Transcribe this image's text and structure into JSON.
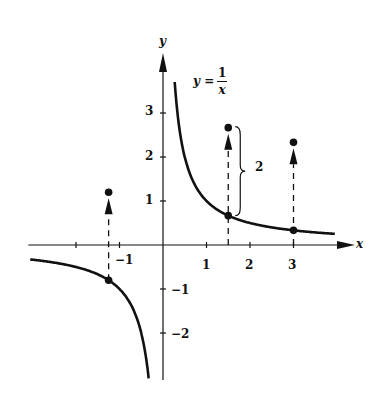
{
  "chart_data": {
    "type": "line",
    "title": "",
    "function_label": {
      "lhs": "y",
      "eq": "=",
      "numerator": "1",
      "denominator": "x"
    },
    "xlabel": "x",
    "ylabel": "y",
    "x_ticks": [
      -2,
      -1,
      0,
      1,
      2,
      3
    ],
    "x_tick_labels": [
      "-1",
      "1",
      "2",
      "3"
    ],
    "y_ticks": [
      -2,
      -1,
      1,
      2,
      3
    ],
    "y_tick_labels": [
      "3",
      "2",
      "1",
      "−1",
      "−2"
    ],
    "xlim": [
      -3.05,
      4.3
    ],
    "ylim": [
      -3.1,
      4.4
    ],
    "grid": false,
    "series": [
      {
        "name": "y = 1/x (x>0)",
        "x_range": [
          0.27,
          3.95
        ]
      },
      {
        "name": "y = 1/x (x<0)",
        "x_range": [
          -3.05,
          -0.33
        ]
      }
    ],
    "highlighted_points": [
      {
        "x": -1.25,
        "y_curve": -0.8,
        "y_shifted": 1.2
      },
      {
        "x": 1.5,
        "y_curve": 0.667,
        "y_shifted": 2.667
      },
      {
        "x": 3,
        "y_curve": 0.333,
        "y_shifted": 2.333
      }
    ],
    "annotations": [
      {
        "type": "brace",
        "label": "2",
        "x": 1.5,
        "from": 0.667,
        "to": 2.667
      }
    ],
    "shift": 2
  },
  "labels": {
    "x_axis": "x",
    "y_axis": "y",
    "brace": "2",
    "xt_m1": "−1",
    "xt_1": "1",
    "xt_2": "2",
    "xt_3": "3",
    "yt_3": "3",
    "yt_2": "2",
    "yt_1": "1",
    "yt_m1": "−1",
    "yt_m2": "−2",
    "eq_lhs": "y =",
    "eq_num": "1",
    "eq_den": "x"
  }
}
